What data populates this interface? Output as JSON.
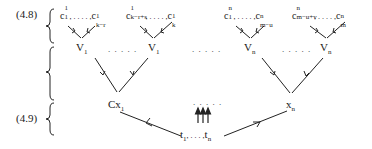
{
  "diagram": {
    "equation_labels": [
      "(4.8)",
      "(4.9)"
    ],
    "top_groups": [
      {
        "base": "c",
        "sup": "1",
        "first_sub": "1",
        "last_sub": "k−r",
        "sep": ", . . . . ,"
      },
      {
        "base": "c",
        "sup": "1",
        "first_sub": "k−r+s",
        "last_sub": "k",
        "sep": ", . . . . ,"
      },
      {
        "base": "c",
        "sup": "n",
        "first_sub": "1",
        "last_sub": "m−u",
        "sep": ", . . . . ,"
      },
      {
        "base": "c",
        "sup": "n",
        "first_sub": "m−u+v",
        "last_sub": "m",
        "sep": ", . . . . ,"
      }
    ],
    "v_nodes": [
      {
        "base": "V",
        "sub": "1"
      },
      {
        "base": "V",
        "sub": "1"
      },
      {
        "base": "V",
        "sub": "n"
      },
      {
        "base": "V",
        "sub": "n"
      }
    ],
    "ellipsis": ". . . . .",
    "middle_nodes": {
      "left": {
        "base": "Cx",
        "sub": "1"
      },
      "right": {
        "base": "x",
        "sub": "n"
      }
    },
    "bottom_node": {
      "first": "t",
      "first_sub": "1",
      "sep": ", . . . ,",
      "last": "t",
      "last_sub": "n"
    },
    "line_color": "#222222"
  }
}
